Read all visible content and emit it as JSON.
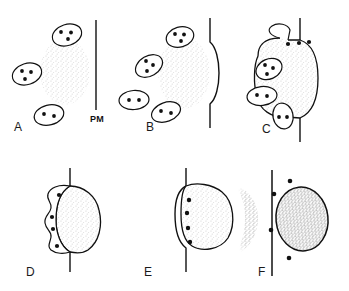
{
  "figure": {
    "type": "schematic-diagram",
    "panel_count": 6,
    "colors": {
      "ink": "#111111",
      "stipple_light": "#f1f1f1",
      "stipple_mid": "#e2e2e2",
      "stipple_dark": "#d2d2d2",
      "background": "#ffffff"
    }
  },
  "labels": {
    "pm": "PM",
    "panel_a": "A",
    "panel_b": "B",
    "panel_c": "C",
    "panel_d": "D",
    "panel_e": "E",
    "panel_f": "F"
  },
  "panels": [
    {
      "id": "A",
      "label": "A",
      "membrane": "straight",
      "membrane_label": "PM",
      "blob": {
        "outline": false,
        "shading": "light-stipple"
      },
      "vesicles": [
        {
          "dots": 3,
          "position": "upper"
        },
        {
          "dots": 3,
          "position": "left"
        },
        {
          "dots": 2,
          "position": "lower"
        }
      ],
      "free_dots": 0
    },
    {
      "id": "B",
      "label": "B",
      "membrane": "bulged-outward",
      "blob": {
        "outline": false,
        "shading": "light-stipple"
      },
      "vesicles": [
        {
          "dots": 3,
          "position": "upper"
        },
        {
          "dots": 3,
          "position": "left-upper"
        },
        {
          "dots": 2,
          "position": "left-lower"
        },
        {
          "dots": 2,
          "position": "lower"
        }
      ],
      "free_dots": 0
    },
    {
      "id": "C",
      "label": "C",
      "membrane": "bulged-outward-with-fusion-pore",
      "blob": {
        "outline": true,
        "shading": "light-stipple"
      },
      "vesicles": [
        {
          "dots": 3,
          "position": "fused-at-top"
        },
        {
          "dots": 3,
          "position": "left-upper"
        },
        {
          "dots": 2,
          "position": "left-middle"
        },
        {
          "dots": 2,
          "position": "left-lower"
        }
      ],
      "free_dots": 1
    },
    {
      "id": "D",
      "label": "D",
      "membrane": "straight-with-gap",
      "blob": {
        "outline": true,
        "shading": "light-stipple"
      },
      "compartment": "scalloped-crescent",
      "vesicles": [],
      "free_dots": 4
    },
    {
      "id": "E",
      "label": "E",
      "membrane": "wrapped-around-blob",
      "blob": {
        "outline": true,
        "shading": "light-stipple"
      },
      "compartment": "narrow-cleft",
      "vesicles": [],
      "free_dots": 4
    },
    {
      "id": "F",
      "label": "F",
      "membrane": "straight",
      "blob": {
        "outline": true,
        "shading": "dark-stipple",
        "position": "outside-cell"
      },
      "remnant": {
        "outline": false,
        "shading": "mid-stipple",
        "position": "inside-cell"
      },
      "vesicles": [],
      "free_dots": 4
    }
  ]
}
